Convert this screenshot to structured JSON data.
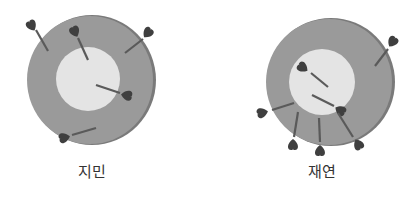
{
  "colors": {
    "outer_ring": "#9a9a9a",
    "outer_ring_edge": "#7a7a7a",
    "inner_circle": "#e4e4e4",
    "dart": "#3f3f3f",
    "shaft": "#5a5a5a",
    "label_text": "#333333"
  },
  "targets": [
    {
      "name": "지민",
      "label": "지민",
      "dart_count": 5,
      "hits_inner": 2,
      "hits_outer": 2,
      "misses": 1
    },
    {
      "name": "재연",
      "label": "재연",
      "dart_count": 7,
      "hits_inner": 2,
      "hits_outer": 4,
      "misses": 1
    }
  ]
}
